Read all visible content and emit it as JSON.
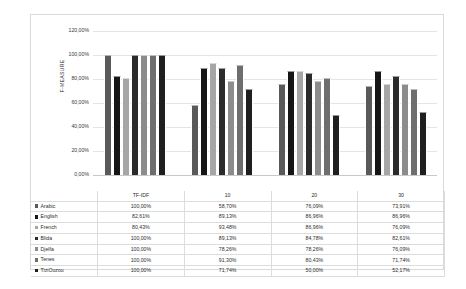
{
  "chart_data": {
    "type": "bar",
    "title": "",
    "xlabel": "",
    "ylabel": "F-MEASURE",
    "ylim": [
      0,
      120
    ],
    "ytick_labels": [
      "0,00%",
      "20,00%",
      "40,00%",
      "60,00%",
      "80,00%",
      "100,00%",
      "120,00%"
    ],
    "ytick_values": [
      0,
      20,
      40,
      60,
      80,
      100,
      120
    ],
    "grid": true,
    "legend_position": "table-left",
    "categories": [
      "TF-IDF",
      "10",
      "20",
      "30"
    ],
    "series": [
      {
        "name": "Arabic",
        "color": "#595959",
        "values": [
          100.0,
          58.7,
          76.09,
          73.91
        ],
        "labels": [
          "100,00%",
          "58,70%",
          "76,09%",
          "73,91%"
        ]
      },
      {
        "name": "English",
        "color": "#151515",
        "values": [
          82.61,
          89.13,
          86.96,
          86.96
        ],
        "labels": [
          "82,61%",
          "89,13%",
          "86,96%",
          "86,96%"
        ]
      },
      {
        "name": "French",
        "color": "#a6a6a6",
        "values": [
          80.43,
          93.48,
          86.96,
          76.09
        ],
        "labels": [
          "80,43%",
          "93,48%",
          "86,96%",
          "76,09%"
        ]
      },
      {
        "name": "Blida",
        "color": "#2b2b2b",
        "values": [
          100.0,
          89.13,
          84.78,
          82.61
        ],
        "labels": [
          "100,00%",
          "89,13%",
          "84,78%",
          "82,61%"
        ]
      },
      {
        "name": "Djelfa",
        "color": "#8c8c8c",
        "values": [
          100.0,
          78.26,
          78.26,
          76.09
        ],
        "labels": [
          "100,00%",
          "78,26%",
          "78,26%",
          "76,09%"
        ]
      },
      {
        "name": "Tenes",
        "color": "#6e6e6e",
        "values": [
          100.0,
          91.3,
          80.43,
          71.74
        ],
        "labels": [
          "100,00%",
          "91,30%",
          "80,43%",
          "71,74%"
        ]
      },
      {
        "name": "TiziOuzou",
        "color": "#1f1f1f",
        "values": [
          100.0,
          71.74,
          50.0,
          52.17
        ],
        "labels": [
          "100,00%",
          "71,74%",
          "50,00%",
          "52,17%"
        ]
      }
    ]
  }
}
